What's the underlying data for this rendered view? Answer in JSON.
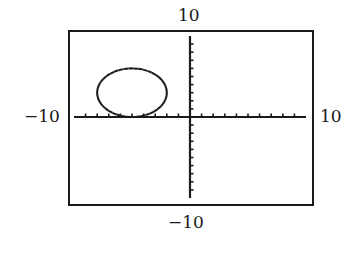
{
  "chart_data": {
    "type": "line",
    "title": "",
    "window": {
      "xmin": -10,
      "xmax": 10,
      "ymin": -10,
      "ymax": 10,
      "xscl": 1,
      "yscl": 1
    },
    "labels": {
      "ymax": "10",
      "ymin": "−10",
      "xmin": "−10",
      "xmax": "10"
    },
    "xlabel": "",
    "ylabel": "",
    "xlim": [
      -10,
      10
    ],
    "ylim": [
      -10,
      10
    ],
    "grid": false,
    "series": [
      {
        "name": "circle",
        "shape": "circle",
        "center": [
          -5,
          3
        ],
        "radius": 3,
        "style": "dotted"
      }
    ],
    "colors": {
      "frame": "#1a1a1a",
      "axis": "#1a1a1a",
      "curve": "#1a1a1a",
      "background": "#ffffff"
    }
  }
}
